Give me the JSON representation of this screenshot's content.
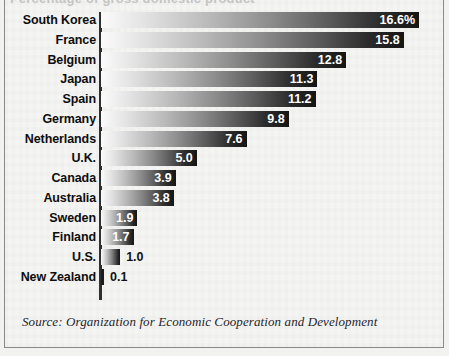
{
  "figure": {
    "partial_title": "Percentage of gross domestic product",
    "source_note": "Source: Organization for Economic Cooperation and Development"
  },
  "chart_data": {
    "type": "bar",
    "orientation": "horizontal",
    "title": "",
    "xlabel": "",
    "ylabel": "",
    "xlim": [
      0,
      16.6
    ],
    "grid": false,
    "legend": null,
    "unit": "%",
    "categories": [
      "South Korea",
      "France",
      "Belgium",
      "Japan",
      "Spain",
      "Germany",
      "Netherlands",
      "U.K.",
      "Canada",
      "Australia",
      "Sweden",
      "Finland",
      "U.S.",
      "New Zealand"
    ],
    "values": [
      16.6,
      15.8,
      12.8,
      11.3,
      11.2,
      9.8,
      7.6,
      5.0,
      3.9,
      3.8,
      1.9,
      1.7,
      1.0,
      0.1
    ],
    "value_labels": [
      "16.6%",
      "15.8",
      "12.8",
      "11.3",
      "11.2",
      "9.8",
      "7.6",
      "5.0",
      "3.9",
      "3.8",
      "1.9",
      "1.7",
      "1.0",
      "0.1"
    ],
    "label_placement": [
      "inside",
      "inside",
      "inside",
      "inside",
      "inside",
      "inside",
      "inside",
      "inside",
      "inside",
      "inside",
      "inside",
      "inside",
      "outside",
      "outside"
    ],
    "colors": {
      "bar_gradient_start": "#fbfbfb",
      "bar_gradient_end": "#151515",
      "axis": "#2f2f2f",
      "label_text": "#0d0d0d",
      "value_text_inside": "#ffffff",
      "value_text_outside": "#111111",
      "background": "#f4f4f3",
      "border": "#8a8a8a"
    }
  }
}
